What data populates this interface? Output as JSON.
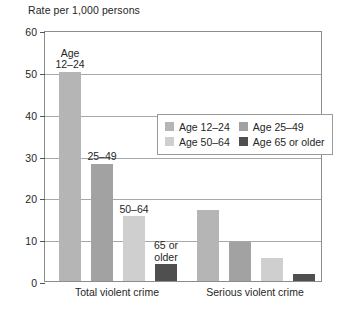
{
  "chart_data": {
    "type": "bar",
    "title": "",
    "ylabel": "Rate per 1,000 persons",
    "xlabel": "",
    "ylim": [
      0,
      60
    ],
    "yticks": [
      0,
      10,
      20,
      30,
      40,
      50,
      60
    ],
    "ytick_labels": [
      "0",
      "10",
      "20",
      "30",
      "40",
      "50",
      "60"
    ],
    "grid": "horizontal",
    "legend_position": "inside-upper-right",
    "categories": [
      "Total violent crime",
      "Serious violent crime"
    ],
    "series": [
      {
        "name": "Age 12–24",
        "color": "#b5b5b5",
        "values": [
          50.0,
          17.0
        ]
      },
      {
        "name": "Age 25–49",
        "color": "#a2a2a2",
        "values": [
          28.0,
          9.3
        ]
      },
      {
        "name": "Age 50–64",
        "color": "#cfcfcf",
        "values": [
          15.5,
          5.5
        ]
      },
      {
        "name": "Age 65 or older",
        "color": "#4f4f4f",
        "values": [
          4.0,
          1.7
        ]
      }
    ],
    "annotations": [
      {
        "text": "Age\n12–24",
        "series": 0,
        "category": 0
      },
      {
        "text": "25–49",
        "series": 1,
        "category": 0
      },
      {
        "text": "50–64",
        "series": 2,
        "category": 0
      },
      {
        "text": "65 or\nolder",
        "series": 3,
        "category": 0
      }
    ]
  },
  "legend": {
    "rows": [
      [
        "Age 12–24",
        "Age 25–49"
      ],
      [
        "Age 50–64",
        "Age 65 or older"
      ]
    ]
  },
  "colors": {
    "series_1": "#b5b5b5",
    "series_2": "#a2a2a2",
    "series_3": "#cfcfcf",
    "series_4": "#4f4f4f",
    "grid": "#a8a8a8",
    "frame": "#8c8c8c",
    "text": "#262626"
  }
}
